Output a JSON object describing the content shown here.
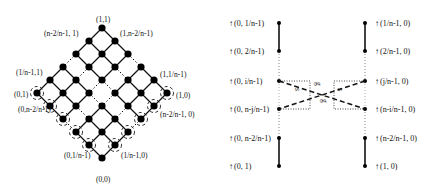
{
  "left_diagram": {
    "name": "lattice-diamond",
    "grid_size": 6,
    "top": {
      "x": 102,
      "y": 28
    },
    "step": 13,
    "dotted_rows": [
      2
    ],
    "dotted_cols": [
      2
    ],
    "labels": [
      {
        "text": "(1,1)",
        "x": 96,
        "y": 22
      },
      {
        "text": "(n-2/n-1, 1)",
        "x": 44,
        "y": 36
      },
      {
        "text": "(1,n-2/n-1)",
        "x": 120,
        "y": 36
      },
      {
        "text": "(1/n-1,1)",
        "x": 16,
        "y": 75
      },
      {
        "text": "(1,1/n-1)",
        "x": 160,
        "y": 77
      },
      {
        "text": "(0,1)",
        "x": 14,
        "y": 97
      },
      {
        "text": "(1,0)",
        "x": 176,
        "y": 98
      },
      {
        "text": "(0,n-2/n-1)",
        "x": 18,
        "y": 112
      },
      {
        "text": "(n-2/n-1, 0)",
        "x": 160,
        "y": 117
      },
      {
        "text": "(0,1/n-1)",
        "x": 64,
        "y": 158
      },
      {
        "text": "(1/n-1,0)",
        "x": 121,
        "y": 158
      },
      {
        "text": "(0,0)",
        "x": 96,
        "y": 182
      }
    ]
  },
  "right_diagram": {
    "name": "chain-crossover",
    "left_chain_x": 279,
    "right_chain_x": 365,
    "left_labels": [
      {
        "text": "(0, 1/n-1)",
        "y": 23
      },
      {
        "text": "(0, 2/n-1)",
        "y": 51
      },
      {
        "text": "(0, i/n-1)",
        "y": 81
      },
      {
        "text": "(0, n-j/n-1)",
        "y": 109
      },
      {
        "text": "(0, n-2/n-1)",
        "y": 138
      },
      {
        "text": "(0, 1)",
        "y": 166
      }
    ],
    "right_labels": [
      {
        "text": "(1/n-1, 0)",
        "y": 23
      },
      {
        "text": "(2/n-1, 0)",
        "y": 51
      },
      {
        "text": "(j/n-1, 0)",
        "y": 81
      },
      {
        "text": "(n-i/n-1, 0)",
        "y": 109
      },
      {
        "text": "(n-2/n-1, 0)",
        "y": 138
      },
      {
        "text": "(1, 0)",
        "y": 166
      }
    ],
    "crossover_labels": [
      {
        "text": "s",
        "sub": "i",
        "x": 295,
        "y": 88
      },
      {
        "text": "g",
        "x": 316,
        "y": 82
      },
      {
        "text": "g",
        "x": 322,
        "y": 99
      },
      {
        "text": "s",
        "x": 338,
        "y": 88
      }
    ]
  }
}
